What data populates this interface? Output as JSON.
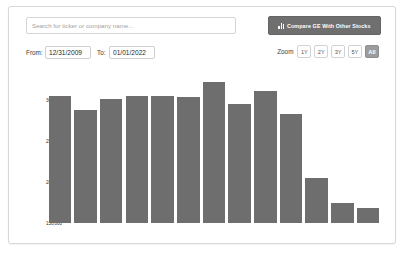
{
  "search": {
    "placeholder": "Search for ticker or company name...",
    "value": ""
  },
  "compare_button": {
    "label": "Compare GE With Other Stocks",
    "icon": "bar-chart-icon",
    "background": "#6f6f6f",
    "text_color": "#ffffff"
  },
  "date_range": {
    "from_label": "From:",
    "from_value": "12/31/2009",
    "to_label": "To:",
    "to_value": "01/01/2022"
  },
  "zoom": {
    "label": "Zoom",
    "options": [
      "1Y",
      "2Y",
      "3Y",
      "5Y",
      "All"
    ],
    "selected": "All",
    "active_background": "#9c9c9c"
  },
  "chart_data": {
    "type": "bar",
    "title": "",
    "xlabel": "",
    "ylabel": "Number of Employees",
    "ylim": [
      150000,
      330000
    ],
    "yticks": [
      150000,
      200000,
      250000,
      300000
    ],
    "ytick_labels": [
      "150,000",
      "200,000",
      "250,000",
      "300,000"
    ],
    "grid": false,
    "legend": false,
    "bar_color": "#6e6e6e",
    "categories": [
      "1",
      "2",
      "3",
      "4",
      "5",
      "6",
      "7",
      "8",
      "9",
      "10",
      "11",
      "12",
      "13"
    ],
    "values": [
      304000,
      287000,
      301000,
      305000,
      305000,
      303000,
      321000,
      295000,
      310000,
      283000,
      205000,
      174000,
      168000
    ]
  }
}
